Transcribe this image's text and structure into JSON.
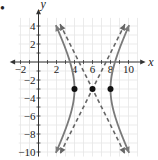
{
  "chart_data": {
    "type": "line",
    "title": "",
    "xlabel": "x",
    "ylabel": "y",
    "xlim": [
      -2,
      11
    ],
    "ylim": [
      -10.5,
      5
    ],
    "grid": true,
    "x_ticks": [
      -2,
      2,
      4,
      6,
      8,
      10
    ],
    "y_ticks": [
      4,
      2,
      -2,
      -4,
      -6,
      -8,
      -10
    ],
    "x_tick_labels": [
      "−2",
      "2",
      "4",
      "6",
      "8",
      "10"
    ],
    "y_tick_labels": [
      "4",
      "2",
      "−2",
      "−4",
      "−6",
      "−8",
      "−10"
    ],
    "series": [
      {
        "name": "hyperbola",
        "style": "solid",
        "color": "#7a7a7a",
        "equation": "(x-6)^2/4 - (y+3)^2/16 = 1",
        "center": [
          6,
          -3
        ],
        "a": 2,
        "b": 4
      },
      {
        "name": "asymptote-1",
        "style": "dashed",
        "color": "#666666",
        "equation": "y + 3 = 2(x - 6)"
      },
      {
        "name": "asymptote-2",
        "style": "dashed",
        "color": "#666666",
        "equation": "y + 3 = -2(x - 6)"
      }
    ],
    "points": [
      {
        "label": "left-vertex",
        "x": 4,
        "y": -3
      },
      {
        "label": "center",
        "x": 6,
        "y": -3
      },
      {
        "label": "right-vertex",
        "x": 8,
        "y": -3
      }
    ]
  },
  "labels": {
    "x_axis": "x",
    "y_axis": "y",
    "bullet": "•"
  },
  "colors": {
    "grid": "#e6e6e6",
    "axis": "#333333",
    "curve": "#7a7a7a",
    "asymptote": "#666666",
    "point": "#111111"
  }
}
